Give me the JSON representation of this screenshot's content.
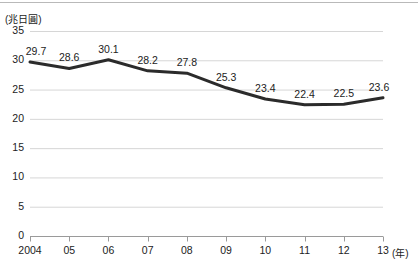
{
  "chart_data": {
    "type": "line",
    "title": "",
    "xlabel": "(年)",
    "ylabel": "(兆日圓)",
    "unit_label": "(兆日圓)",
    "x_axis_unit": "(年)",
    "categories": [
      "2004",
      "05",
      "06",
      "07",
      "08",
      "09",
      "10",
      "11",
      "12",
      "13"
    ],
    "values": [
      29.7,
      28.6,
      30.1,
      28.2,
      27.8,
      25.3,
      23.4,
      22.4,
      22.5,
      23.6
    ],
    "point_labels": [
      "29.7",
      "28.6",
      "30.1",
      "28.2",
      "27.8",
      "25.3",
      "23.4",
      "22.4",
      "22.5",
      "23.6"
    ],
    "ylim": [
      0,
      35
    ],
    "y_ticks": [
      0,
      5,
      10,
      15,
      20,
      25,
      30,
      35
    ],
    "y_tick_labels": [
      "0",
      "5",
      "10",
      "15",
      "20",
      "25",
      "30",
      "35"
    ],
    "grid": true,
    "grid_axis": "y",
    "legend": false,
    "legend_position": "none",
    "markers": false,
    "series": [
      {
        "name": "",
        "values": [
          29.7,
          28.6,
          30.1,
          28.2,
          27.8,
          25.3,
          23.4,
          22.4,
          22.5,
          23.6
        ]
      }
    ]
  },
  "colors": {
    "line": "#2b2b2b",
    "grid": "#d6d6d6",
    "axis": "#9a9a9a",
    "text": "#1c1c1c",
    "background": "#ffffff",
    "top_rule": "#b9b9b9"
  }
}
